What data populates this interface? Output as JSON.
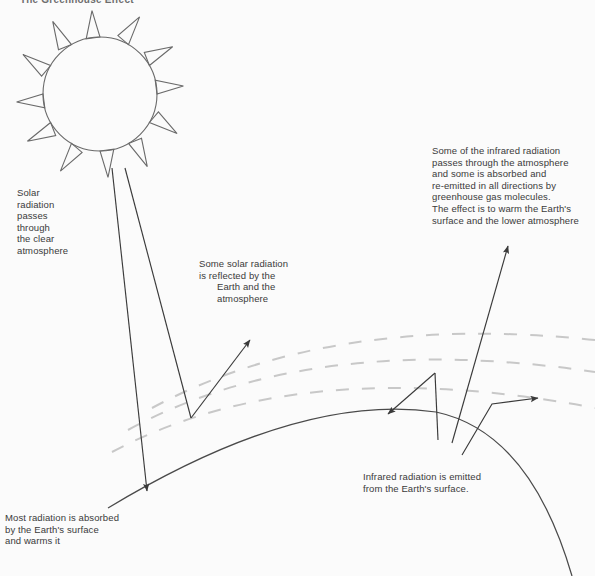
{
  "document": {
    "title_clipped": "The Greenhouse Effect",
    "background_color": "#fbfbfb",
    "ink_color": "#4a4a4a",
    "atmosphere_dash_color": "#c8c8c8"
  },
  "labels": {
    "solar_passes": "Solar\nradiation\npasses\nthrough\nthe clear\natmosphere",
    "reflected_line1": "Some solar radiation",
    "reflected_line2": "is reflected by the",
    "reflected_line3": "Earth and the",
    "reflected_line4": "atmosphere",
    "infrared_up": "Some of the infrared radiation\npasses through the atmosphere\nand some is absorbed and\nre-emitted in all directions by\ngreenhouse gas molecules.\nThe effect is to warm the Earth's\nsurface and the lower atmosphere",
    "infrared_emitted": "Infrared radiation  is emitted\nfrom the Earth's surface.",
    "most_absorbed": "Most radiation is absorbed\nby the Earth's surface\nand warms it"
  },
  "figure": {
    "sun": {
      "name": "sun",
      "center_x": 100,
      "center_y": 94,
      "radius": 57,
      "ray_count": 12,
      "ray_length": 27
    },
    "earth": {
      "name": "earth-surface-curve",
      "description": "solid arc representing the curved surface of the Earth"
    },
    "atmosphere": {
      "name": "atmosphere-dashed-arcs",
      "arc_count": 3,
      "style": "dashed"
    },
    "arrows": [
      {
        "name": "solar-ray-incoming-left",
        "label_ref": "solar_passes",
        "direction": "down-right"
      },
      {
        "name": "solar-ray-incoming-right",
        "label_ref": "solar_passes",
        "direction": "down-right"
      },
      {
        "name": "solar-ray-reflected",
        "label_ref": "reflected_line1",
        "direction": "up-right"
      },
      {
        "name": "infrared-reflected-short",
        "label_ref": "infrared_emitted",
        "direction": "down-left"
      },
      {
        "name": "infrared-escape-long",
        "label_ref": "infrared_up",
        "direction": "up-right"
      },
      {
        "name": "infrared-reemitted",
        "label_ref": "infrared_up",
        "direction": "up-right"
      }
    ]
  }
}
